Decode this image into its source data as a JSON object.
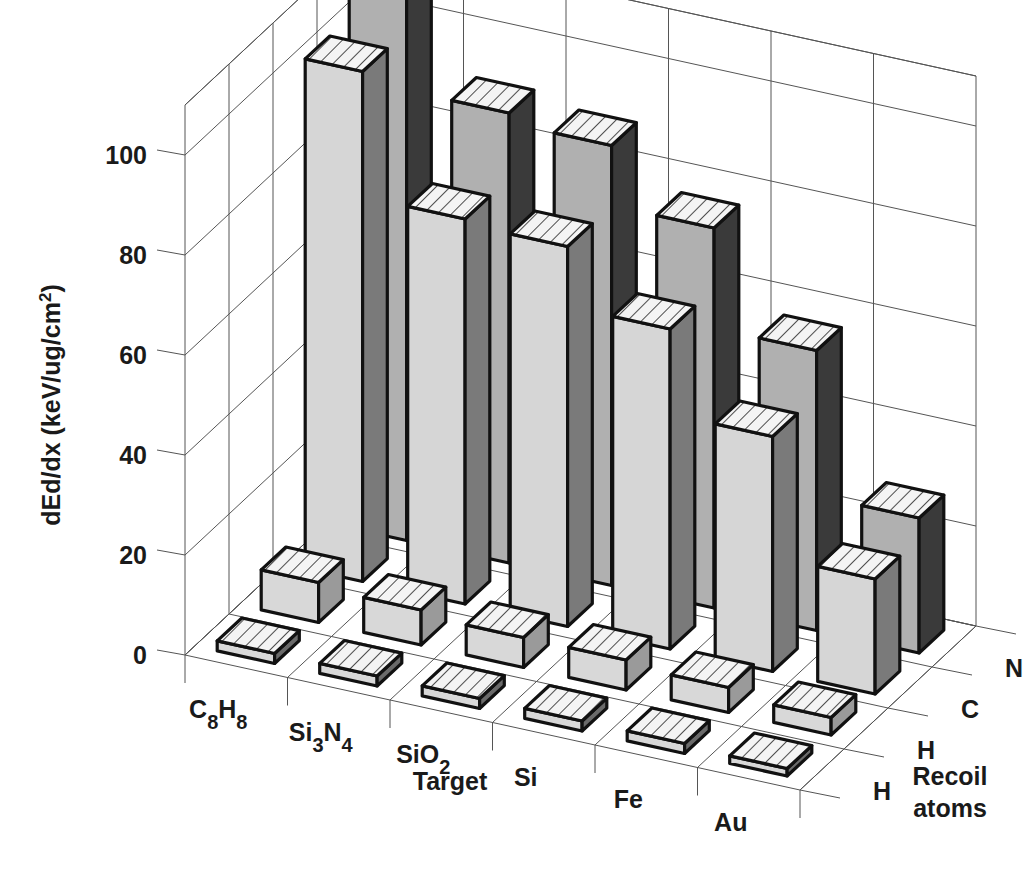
{
  "chart_data": {
    "type": "bar",
    "subtype": "3d-grouped-bar",
    "title": "",
    "ylabel": "dEd/dx (keV/ug/cm²)",
    "ylabel_parts": {
      "main": "dEd/dx (keV/ug/cm",
      "sup": "2",
      "end": ")"
    },
    "xlabel": "Target",
    "zlabel": "Recoil atoms",
    "zlabel_lines": [
      "Recoil",
      "atoms"
    ],
    "ylim": [
      0,
      110
    ],
    "yticks": [
      0,
      20,
      40,
      60,
      80,
      100
    ],
    "grid": true,
    "categories": [
      {
        "label": "C8H8",
        "parts": [
          [
            "C",
            ""
          ],
          [
            "8",
            "sub"
          ],
          [
            "H",
            ""
          ],
          [
            "8",
            "sub"
          ]
        ]
      },
      {
        "label": "Si3N4",
        "parts": [
          [
            "Si",
            ""
          ],
          [
            "3",
            "sub"
          ],
          [
            "N",
            ""
          ],
          [
            "4",
            "sub"
          ]
        ]
      },
      {
        "label": "SiO2",
        "parts": [
          [
            "SiO",
            ""
          ],
          [
            "2",
            "sub"
          ]
        ]
      },
      {
        "label": "Si",
        "parts": [
          [
            "Si",
            ""
          ]
        ]
      },
      {
        "label": "Fe",
        "parts": [
          [
            "Fe",
            ""
          ]
        ]
      },
      {
        "label": "Au",
        "parts": [
          [
            "Au",
            ""
          ]
        ]
      }
    ],
    "series": [
      {
        "name": "H",
        "row": "front",
        "values": [
          2,
          2,
          2,
          2,
          2,
          1.5
        ]
      },
      {
        "name": "H",
        "row": "second",
        "values": [
          8,
          7,
          6,
          6,
          5,
          3.5
        ]
      },
      {
        "name": "C",
        "row": "third",
        "values": [
          102,
          77,
          76,
          64,
          47,
          23
        ]
      },
      {
        "name": "N",
        "row": "back",
        "values": [
          113,
          90,
          88,
          76,
          56,
          27
        ]
      }
    ],
    "colors": {
      "front_face": [
        "#d8d8d8",
        "#d8d8d8",
        "#d6d6d6",
        "#b0b0b0"
      ],
      "side_face": [
        "#6a6a6a",
        "#9a9a9a",
        "#7a7a7a",
        "#3a3a3a"
      ],
      "top_face": "#f4f4f4"
    }
  }
}
